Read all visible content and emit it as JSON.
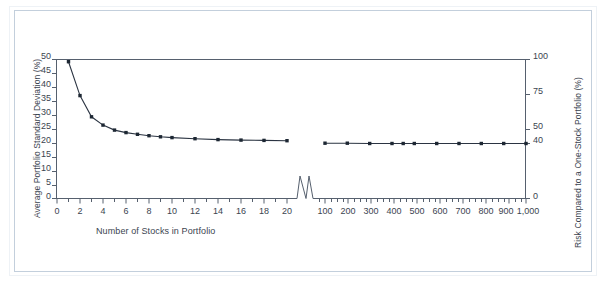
{
  "chart_data": {
    "type": "line",
    "title": "",
    "xlabel": "Number of Stocks in Portfolio",
    "ylabel": "Average Portfolio Standard Deviation (%)",
    "y2label": "Risk Compared to a One-Stock Portfolio (%)",
    "ylim": [
      0,
      50
    ],
    "y2lim": [
      0,
      100
    ],
    "yticks": [
      0,
      5,
      10,
      15,
      20,
      25,
      30,
      35,
      40,
      45,
      50
    ],
    "ytick_labels": [
      "0",
      "5",
      "10",
      "15",
      "20",
      "25",
      "30",
      "35",
      "40",
      "45",
      "50"
    ],
    "y2ticks": [
      0,
      40,
      50,
      75,
      100
    ],
    "y2tick_labels": [
      "0",
      "40",
      "50",
      "75",
      "100"
    ],
    "grid": false,
    "legend": "none",
    "axis_break": true,
    "axis_break_note": "x-axis broken between 21 and 100 stocks, marked with a zigzag symbol",
    "x_segments": [
      {
        "name": "left",
        "xlim": [
          0,
          21
        ],
        "major_ticks": [
          0,
          2,
          4,
          6,
          8,
          10,
          12,
          14,
          16,
          18,
          20
        ],
        "major_tick_labels": [
          "0",
          "2",
          "4",
          "6",
          "8",
          "10",
          "12",
          "14",
          "16",
          "18",
          "20"
        ],
        "minor_tick_step": 1
      },
      {
        "name": "right",
        "xlim": [
          60,
          1000
        ],
        "major_ticks": [
          100,
          200,
          300,
          400,
          500,
          600,
          700,
          800,
          900,
          1000
        ],
        "major_tick_labels": [
          "100",
          "200",
          "300",
          "400",
          "500",
          "600",
          "700",
          "800",
          "900",
          "1,000"
        ],
        "minor_tick_step": 25
      }
    ],
    "series": [
      {
        "name": "Average portfolio standard deviation (small portfolios)",
        "segment": "left",
        "marker": "square",
        "color": "#1d2733",
        "x": [
          1,
          2,
          3,
          4,
          5,
          6,
          7,
          8,
          9,
          10,
          12,
          14,
          16,
          18,
          20
        ],
        "y": [
          49.2,
          37.0,
          29.4,
          26.4,
          24.6,
          23.7,
          23.1,
          22.6,
          22.2,
          21.9,
          21.5,
          21.2,
          21.0,
          20.9,
          20.8
        ]
      },
      {
        "name": "Average portfolio standard deviation (large portfolios)",
        "segment": "right",
        "marker": "square",
        "color": "#1d2733",
        "x": [
          100,
          200,
          300,
          400,
          450,
          500,
          600,
          700,
          800,
          900,
          1000
        ],
        "y": [
          19.9,
          19.9,
          19.8,
          19.8,
          19.8,
          19.8,
          19.8,
          19.8,
          19.8,
          19.8,
          19.8
        ]
      }
    ],
    "reference_lines": [
      {
        "name": "top-frame",
        "axis": "y",
        "value": 50,
        "y2_value": 100
      },
      {
        "name": "forty-percent-marker",
        "axis": "y2",
        "value": 40
      }
    ],
    "colors": {
      "line": "#2b3442",
      "marker": "#111820",
      "axis": "#56606e",
      "text": "#3b4450",
      "frame": "#c3cfdc",
      "background": "#ffffff"
    }
  }
}
